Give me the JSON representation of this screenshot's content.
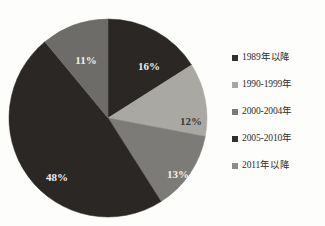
{
  "chart_data": {
    "type": "pie",
    "title": "",
    "subtitle": "",
    "xlabel": "",
    "ylabel": "",
    "grid": false,
    "legend_position": "right",
    "start_angle_deg": 0,
    "direction": "clockwise",
    "categories": [
      "1989年以降",
      "1990-1999年",
      "2000-2004年",
      "2005-2010年",
      "2011年以降"
    ],
    "values": [
      16,
      12,
      13,
      48,
      11
    ],
    "value_unit": "%",
    "data_labels": [
      "16%",
      "12%",
      "13%",
      "48%",
      "11%"
    ],
    "colors": [
      "#2b2724",
      "#aaa8a3",
      "#7d7b77",
      "#2b2724",
      "#6e6c68"
    ],
    "slices": [
      {
        "name": "1989年以降",
        "value": 16,
        "label": "16%",
        "color": "#2b2724",
        "label_color": "light",
        "label_x": 143,
        "label_y": 54
      },
      {
        "name": "1990-1999年",
        "value": 12,
        "label": "12%",
        "color": "#aaa8a3",
        "label_color": "dark",
        "label_y": 109,
        "label_x": 185
      },
      {
        "name": "2000-2004年",
        "value": 13,
        "label": "13%",
        "color": "#7d7b77",
        "label_color": "light",
        "label_x": 172,
        "label_y": 162
      },
      {
        "name": "2005-2010年",
        "value": 48,
        "label": "48%",
        "color": "#2b2724",
        "label_color": "light",
        "label_x": 51,
        "label_y": 165
      },
      {
        "name": "2011年以降",
        "value": 11,
        "label": "11%",
        "color": "#6e6c68",
        "label_color": "light",
        "label_x": 80,
        "label_y": 48
      }
    ]
  },
  "legend": {
    "items": [
      {
        "label": "1989年以降",
        "color": "#332f2c",
        "swatch": "legend-swatch-square"
      },
      {
        "label": "1990-1999年",
        "color": "#a9a7a2",
        "swatch": "legend-swatch-square"
      },
      {
        "label": "2000-2004年",
        "color": "#7b7975",
        "swatch": "legend-swatch-square"
      },
      {
        "label": "2005-2010年",
        "color": "#332f2c",
        "swatch": "legend-swatch-square"
      },
      {
        "label": "2011年以降",
        "color": "#8e8c88",
        "swatch": "legend-swatch-square"
      }
    ]
  },
  "geometry": {
    "center_x": 102,
    "center_y": 102,
    "radius": 99
  }
}
